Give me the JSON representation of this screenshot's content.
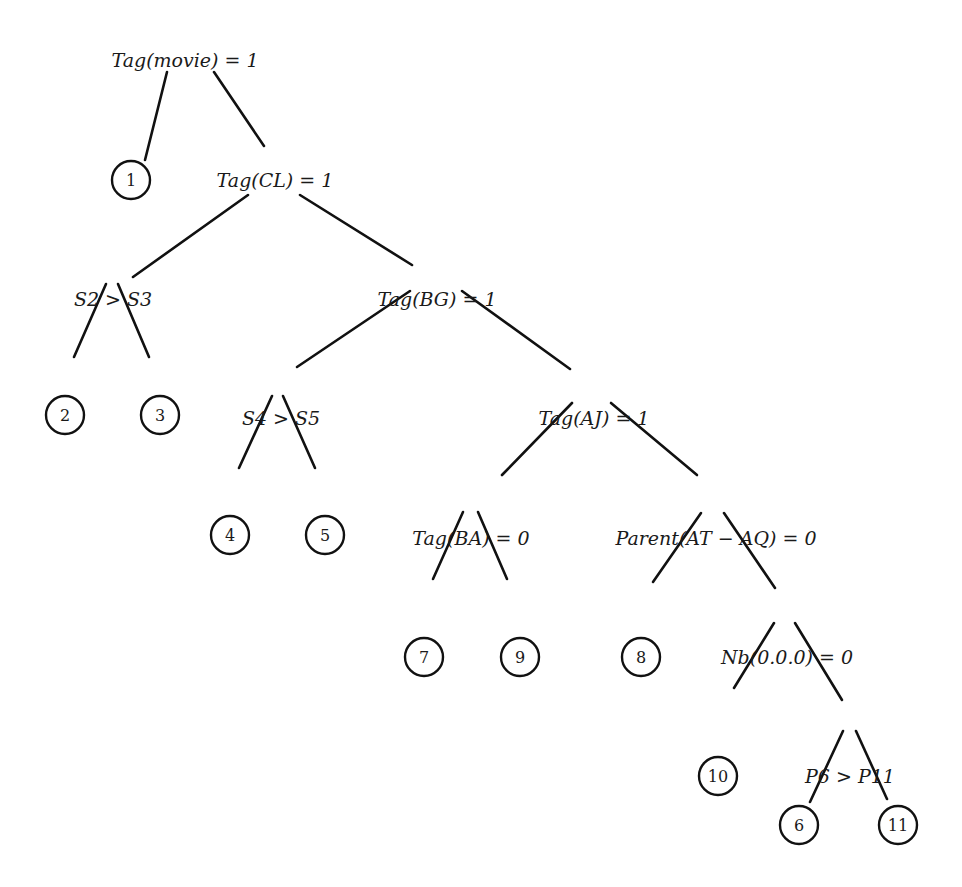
{
  "diagram": {
    "type": "decision-tree",
    "colors": {
      "line": "#111111",
      "text": "#1a1a1a",
      "background": "#ffffff"
    },
    "nodes": [
      {
        "id": "root",
        "kind": "test",
        "label": "Tag(movie) = 1",
        "x": 185,
        "y": 60
      },
      {
        "id": "L1",
        "kind": "leaf",
        "label": "1",
        "x": 131,
        "y": 180
      },
      {
        "id": "tagCL",
        "kind": "test",
        "label": "Tag(CL) = 1",
        "x": 275,
        "y": 180
      },
      {
        "id": "s2s3",
        "kind": "test",
        "label": "S2 > S3",
        "x": 113,
        "y": 299
      },
      {
        "id": "tagBG",
        "kind": "test",
        "label": "Tag(BG) = 1",
        "x": 437,
        "y": 299
      },
      {
        "id": "L2",
        "kind": "leaf",
        "label": "2",
        "x": 65,
        "y": 415
      },
      {
        "id": "L3",
        "kind": "leaf",
        "label": "3",
        "x": 160,
        "y": 415
      },
      {
        "id": "s4s5",
        "kind": "test",
        "label": "S4 > S5",
        "x": 281,
        "y": 418
      },
      {
        "id": "tagAJ",
        "kind": "test",
        "label": "Tag(AJ) = 1",
        "x": 594,
        "y": 418
      },
      {
        "id": "L4",
        "kind": "leaf",
        "label": "4",
        "x": 230,
        "y": 535
      },
      {
        "id": "L5",
        "kind": "leaf",
        "label": "5",
        "x": 325,
        "y": 535
      },
      {
        "id": "tagBA",
        "kind": "test",
        "label": "Tag(BA) = 0",
        "x": 471,
        "y": 538
      },
      {
        "id": "parent",
        "kind": "test",
        "label": "Parent(AT − AQ) = 0",
        "x": 716,
        "y": 538
      },
      {
        "id": "L7",
        "kind": "leaf",
        "label": "7",
        "x": 424,
        "y": 657
      },
      {
        "id": "L9",
        "kind": "leaf",
        "label": "9",
        "x": 520,
        "y": 657
      },
      {
        "id": "L8",
        "kind": "leaf",
        "label": "8",
        "x": 641,
        "y": 657
      },
      {
        "id": "nb000",
        "kind": "test",
        "label": "Nb(0.0.0) = 0",
        "x": 787,
        "y": 657
      },
      {
        "id": "L10",
        "kind": "leaf",
        "label": "10",
        "x": 718,
        "y": 776
      },
      {
        "id": "p6p11",
        "kind": "test",
        "label": "P6 > P11",
        "x": 850,
        "y": 776
      },
      {
        "id": "L6",
        "kind": "leaf",
        "label": "6",
        "x": 799,
        "y": 825
      },
      {
        "id": "L11",
        "kind": "leaf",
        "label": "11",
        "x": 898,
        "y": 825
      }
    ],
    "edges": [
      {
        "from": "root",
        "to": "L1",
        "x1": 167,
        "y1": 72,
        "x2": 145,
        "y2": 160
      },
      {
        "from": "root",
        "to": "tagCL",
        "x1": 214,
        "y1": 72,
        "x2": 264,
        "y2": 146
      },
      {
        "from": "tagCL",
        "to": "s2s3",
        "x1": 248,
        "y1": 195,
        "x2": 133,
        "y2": 277
      },
      {
        "from": "tagCL",
        "to": "tagBG",
        "x1": 300,
        "y1": 195,
        "x2": 412,
        "y2": 265
      },
      {
        "from": "s2s3",
        "to": "L2",
        "x1": 106,
        "y1": 284,
        "x2": 74,
        "y2": 357
      },
      {
        "from": "s2s3",
        "to": "L3",
        "x1": 118,
        "y1": 284,
        "x2": 149,
        "y2": 357
      },
      {
        "from": "tagBG",
        "to": "s4s5",
        "x1": 410,
        "y1": 291,
        "x2": 297,
        "y2": 367
      },
      {
        "from": "tagBG",
        "to": "tagAJ",
        "x1": 462,
        "y1": 291,
        "x2": 570,
        "y2": 369
      },
      {
        "from": "s4s5",
        "to": "L4",
        "x1": 272,
        "y1": 396,
        "x2": 239,
        "y2": 468
      },
      {
        "from": "s4s5",
        "to": "L5",
        "x1": 283,
        "y1": 396,
        "x2": 315,
        "y2": 468
      },
      {
        "from": "tagAJ",
        "to": "tagBA",
        "x1": 572,
        "y1": 403,
        "x2": 502,
        "y2": 475
      },
      {
        "from": "tagAJ",
        "to": "parent",
        "x1": 611,
        "y1": 403,
        "x2": 697,
        "y2": 475
      },
      {
        "from": "tagBA",
        "to": "L7",
        "x1": 463,
        "y1": 512,
        "x2": 433,
        "y2": 579
      },
      {
        "from": "tagBA",
        "to": "L9",
        "x1": 478,
        "y1": 512,
        "x2": 507,
        "y2": 579
      },
      {
        "from": "parent",
        "to": "L8",
        "x1": 701,
        "y1": 513,
        "x2": 653,
        "y2": 582
      },
      {
        "from": "parent",
        "to": "nb000",
        "x1": 724,
        "y1": 513,
        "x2": 775,
        "y2": 588
      },
      {
        "from": "nb000",
        "to": "L10",
        "x1": 774,
        "y1": 623,
        "x2": 734,
        "y2": 688
      },
      {
        "from": "nb000",
        "to": "p6p11",
        "x1": 795,
        "y1": 623,
        "x2": 842,
        "y2": 700
      },
      {
        "from": "p6p11",
        "to": "L6",
        "x1": 843,
        "y1": 731,
        "x2": 810,
        "y2": 802
      },
      {
        "from": "p6p11",
        "to": "L11",
        "x1": 856,
        "y1": 731,
        "x2": 887,
        "y2": 799
      }
    ],
    "leaf_radius": 19
  }
}
